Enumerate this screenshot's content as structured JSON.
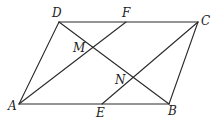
{
  "diagram": {
    "type": "geometry-parallelogram",
    "points": {
      "A": {
        "label": "A",
        "x": 19,
        "y": 104,
        "lx": 8,
        "ly": 110
      },
      "B": {
        "label": "B",
        "x": 169,
        "y": 104,
        "lx": 168,
        "ly": 115
      },
      "C": {
        "label": "C",
        "x": 198,
        "y": 22,
        "lx": 201,
        "ly": 25
      },
      "D": {
        "label": "D",
        "x": 59,
        "y": 22,
        "lx": 52,
        "ly": 17
      },
      "E": {
        "label": "E",
        "x": 102,
        "y": 104,
        "lx": 96,
        "ly": 117
      },
      "F": {
        "label": "F",
        "x": 126,
        "y": 22,
        "lx": 122,
        "ly": 17
      },
      "M": {
        "label": "M",
        "x": 93,
        "y": 47,
        "lx": 73,
        "ly": 52
      },
      "N": {
        "label": "N",
        "x": 133,
        "y": 77,
        "lx": 115,
        "ly": 84
      }
    },
    "segments": [
      {
        "from": "A",
        "to": "B"
      },
      {
        "from": "B",
        "to": "C"
      },
      {
        "from": "C",
        "to": "D"
      },
      {
        "from": "D",
        "to": "A"
      },
      {
        "from": "D",
        "to": "B"
      },
      {
        "from": "A",
        "to": "F"
      },
      {
        "from": "E",
        "to": "C"
      }
    ],
    "stroke_color": "#2a2a2a",
    "label_color": "#222222"
  }
}
